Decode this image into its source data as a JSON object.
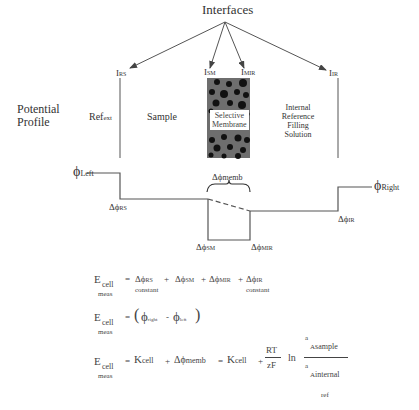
{
  "diagram": {
    "title": "Interfaces",
    "side_label": [
      "Potential",
      "Profile"
    ],
    "interfaces": [
      {
        "label": "I",
        "sub": "RS"
      },
      {
        "label": "I",
        "sub": "SM"
      },
      {
        "label": "I",
        "sub": "MIR"
      },
      {
        "label": "I",
        "sub": "IR"
      }
    ],
    "regions": {
      "ref_ext": {
        "label": "Ref",
        "sub": "ext"
      },
      "sample": "Sample",
      "membrane": [
        "Selective",
        "Membrane"
      ],
      "internal": [
        "Internal",
        "Reference",
        "Filling",
        "Solution"
      ]
    },
    "potentials": {
      "phi_left": {
        "label": "ϕ",
        "sub": "Left"
      },
      "phi_right": {
        "label": "ϕ",
        "sub": "Right"
      },
      "d_rs": {
        "label": "Δϕ",
        "sub": "RS"
      },
      "d_memb": {
        "label": "Δϕ",
        "sub": "memb"
      },
      "d_sm": {
        "label": "Δϕ",
        "sub": "SM"
      },
      "d_mir": {
        "label": "Δϕ",
        "sub": "MIR"
      },
      "d_ir": {
        "label": "Δϕ",
        "sub": "IR"
      }
    },
    "colors": {
      "line": "#555555",
      "membrane_bg": "#6e6e6e",
      "particle": "#111111"
    }
  },
  "equations": {
    "eq1": {
      "lhs": "E",
      "lhs_sub": "cell",
      "lhs_under": "meas",
      "eq": "=",
      "t1": "Δϕ",
      "t1_sub": "RS",
      "t1_under": "constant",
      "plus": "+",
      "t2": "Δϕ",
      "t2_sub": "SM",
      "t3": "Δϕ",
      "t3_sub": "MIR",
      "t4": "Δϕ",
      "t4_sub": "IR",
      "t4_under": "constant"
    },
    "eq2": {
      "lhs": "E",
      "lhs_sub": "cell",
      "lhs_under": "meas",
      "eq": "=",
      "open": "(",
      "close": ")",
      "a": "ϕ",
      "a_sub": "right",
      "minus": "-",
      "b": "ϕ",
      "b_sub": "left"
    },
    "eq3": {
      "lhs": "E",
      "lhs_sub": "cell",
      "lhs_under": "meas",
      "eq": "=",
      "k": "K",
      "k_sub": "cell",
      "plus": "+",
      "dm": "Δϕ",
      "dm_sub": "memb",
      "k2": "K",
      "k2_sub": "cell",
      "num": "RT",
      "den": "zF",
      "ln": "ln",
      "a_top": "a",
      "A_top": "A",
      "A_top_sub": "sample",
      "a_bot": "a",
      "A_bot": "A",
      "A_bot_sub": "internal",
      "A_bot_sub2": "ref"
    }
  }
}
